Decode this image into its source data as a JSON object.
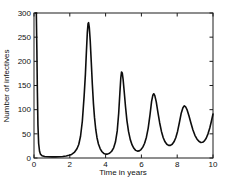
{
  "figure": {
    "background": "#ffffff",
    "frame_color": "#1c1c1c",
    "tick_color": "#1c1c1c",
    "text_color": "#111111",
    "line_color": "#0d0d0d"
  },
  "chart_data": {
    "type": "line",
    "title": "",
    "xlabel": "Time in years",
    "ylabel": "Number of infectives",
    "xlim": [
      0,
      10
    ],
    "ylim": [
      0,
      300
    ],
    "xticks": [
      "0",
      "2",
      "4",
      "6",
      "8",
      "10"
    ],
    "xtick_values": [
      0,
      2,
      4,
      6,
      8,
      10
    ],
    "yticks": [
      "0",
      "50",
      "100",
      "150",
      "200",
      "250",
      "300"
    ],
    "ytick_values": [
      0,
      50,
      100,
      150,
      200,
      250,
      300
    ],
    "grid": false,
    "legend_position": "none",
    "series": [
      {
        "name": "infectives",
        "color": "#0d0d0d",
        "points": [
          [
            0.1,
            300
          ],
          [
            0.13,
            300
          ],
          [
            0.16,
            225
          ],
          [
            0.19,
            135
          ],
          [
            0.22,
            68
          ],
          [
            0.26,
            30
          ],
          [
            0.31,
            14
          ],
          [
            0.36,
            8
          ],
          [
            0.45,
            4.5
          ],
          [
            0.6,
            3
          ],
          [
            0.8,
            2.5
          ],
          [
            1.0,
            2.3
          ],
          [
            1.2,
            2.4
          ],
          [
            1.4,
            2.7
          ],
          [
            1.6,
            3.2
          ],
          [
            1.8,
            4.3
          ],
          [
            1.95,
            5.5
          ],
          [
            2.1,
            7.5
          ],
          [
            2.25,
            11.5
          ],
          [
            2.4,
            19
          ],
          [
            2.5,
            28
          ],
          [
            2.6,
            45
          ],
          [
            2.7,
            76
          ],
          [
            2.8,
            128
          ],
          [
            2.87,
            172
          ],
          [
            2.93,
            222
          ],
          [
            2.98,
            260
          ],
          [
            3.02,
            278
          ],
          [
            3.05,
            280
          ],
          [
            3.09,
            270
          ],
          [
            3.14,
            243
          ],
          [
            3.2,
            198
          ],
          [
            3.26,
            152
          ],
          [
            3.32,
            113
          ],
          [
            3.38,
            84
          ],
          [
            3.45,
            59
          ],
          [
            3.52,
            42
          ],
          [
            3.6,
            29
          ],
          [
            3.7,
            19
          ],
          [
            3.8,
            13
          ],
          [
            3.9,
            9.5
          ],
          [
            4.0,
            8
          ],
          [
            4.1,
            8
          ],
          [
            4.22,
            9.8
          ],
          [
            4.34,
            14
          ],
          [
            4.45,
            21
          ],
          [
            4.55,
            33
          ],
          [
            4.65,
            56
          ],
          [
            4.73,
            92
          ],
          [
            4.8,
            136
          ],
          [
            4.85,
            166
          ],
          [
            4.89,
            178
          ],
          [
            4.93,
            176
          ],
          [
            4.98,
            162
          ],
          [
            5.04,
            137
          ],
          [
            5.11,
            107
          ],
          [
            5.19,
            78
          ],
          [
            5.28,
            55
          ],
          [
            5.38,
            38
          ],
          [
            5.48,
            27
          ],
          [
            5.58,
            20
          ],
          [
            5.68,
            15.8
          ],
          [
            5.78,
            14.2
          ],
          [
            5.88,
            14.8
          ],
          [
            5.98,
            17.5
          ],
          [
            6.08,
            22.5
          ],
          [
            6.18,
            30.5
          ],
          [
            6.28,
            43
          ],
          [
            6.38,
            62
          ],
          [
            6.48,
            89
          ],
          [
            6.57,
            117
          ],
          [
            6.64,
            130
          ],
          [
            6.69,
            133
          ],
          [
            6.75,
            129
          ],
          [
            6.83,
            116
          ],
          [
            6.92,
            95
          ],
          [
            7.02,
            73
          ],
          [
            7.12,
            55
          ],
          [
            7.22,
            42
          ],
          [
            7.32,
            33.5
          ],
          [
            7.42,
            28.5
          ],
          [
            7.52,
            26.2
          ],
          [
            7.62,
            26.2
          ],
          [
            7.72,
            28.5
          ],
          [
            7.82,
            33.5
          ],
          [
            7.92,
            42
          ],
          [
            8.02,
            55
          ],
          [
            8.12,
            73
          ],
          [
            8.22,
            92
          ],
          [
            8.32,
            104
          ],
          [
            8.4,
            108
          ],
          [
            8.47,
            106
          ],
          [
            8.56,
            99
          ],
          [
            8.66,
            87
          ],
          [
            8.77,
            72
          ],
          [
            8.88,
            58
          ],
          [
            8.99,
            47
          ],
          [
            9.1,
            39.5
          ],
          [
            9.21,
            34.5
          ],
          [
            9.32,
            32.2
          ],
          [
            9.42,
            32.5
          ],
          [
            9.52,
            35.5
          ],
          [
            9.62,
            41
          ],
          [
            9.72,
            50
          ],
          [
            9.82,
            62
          ],
          [
            9.91,
            76
          ],
          [
            10.0,
            91
          ]
        ]
      }
    ]
  }
}
